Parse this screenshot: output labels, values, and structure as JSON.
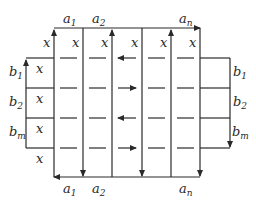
{
  "diagram": {
    "top_labels": [
      {
        "base": "a",
        "sub": "1",
        "x": 60
      },
      {
        "base": "a",
        "sub": "2",
        "x": 89
      },
      {
        "base": "a",
        "sub": "n",
        "x": 176
      }
    ],
    "bottom_labels": [
      {
        "base": "a",
        "sub": "1",
        "x": 60
      },
      {
        "base": "a",
        "sub": "2",
        "x": 89
      },
      {
        "base": "a",
        "sub": "n",
        "x": 176
      }
    ],
    "left_labels": [
      {
        "base": "b",
        "sub": "1",
        "y": 78
      },
      {
        "base": "b",
        "sub": "2",
        "y": 108
      },
      {
        "base": "b",
        "sub": "m",
        "y": 138
      }
    ],
    "right_labels": [
      {
        "base": "b",
        "sub": "1",
        "y": 78
      },
      {
        "base": "b",
        "sub": "2",
        "y": 108
      },
      {
        "base": "b",
        "sub": "m",
        "y": 138
      }
    ],
    "cell_symbol": "x",
    "top_x_row": [
      "x",
      "x",
      "x",
      "x",
      "x",
      "x"
    ],
    "left_column_x": [
      "x",
      "x",
      "x",
      "x"
    ],
    "row_arrow_directions": [
      "left",
      "right",
      "left",
      "right"
    ],
    "vertical_arrow_directions": [
      "up",
      "down",
      "up",
      "down",
      "up",
      "down"
    ]
  }
}
